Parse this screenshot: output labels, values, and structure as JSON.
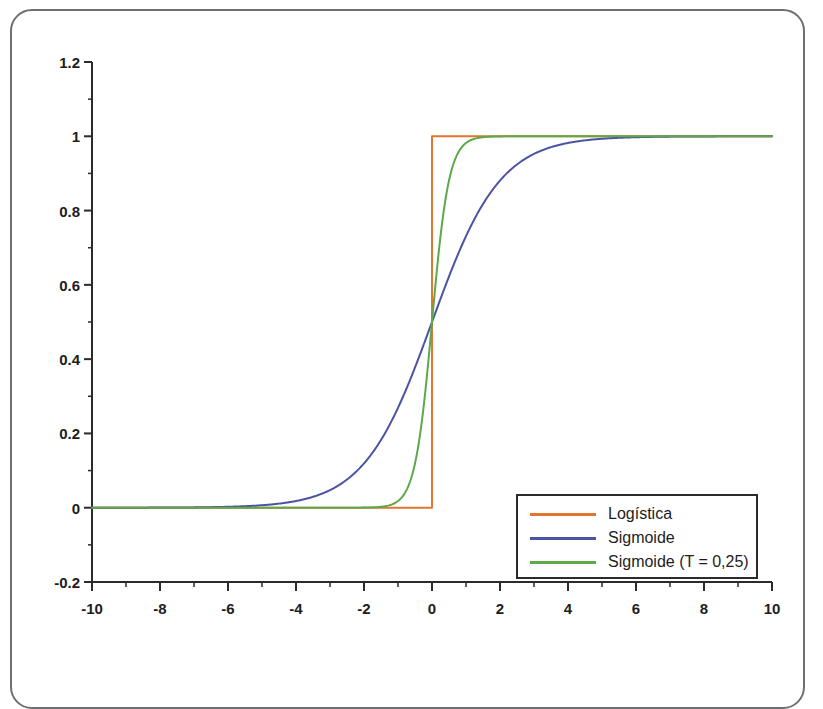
{
  "chart_data": {
    "type": "line",
    "title": "",
    "xlabel": "",
    "ylabel": "",
    "xlim": [
      -10,
      10
    ],
    "ylim": [
      -0.2,
      1.2
    ],
    "grid": false,
    "legend_position": "bottom-right",
    "x_ticks": [
      "-10",
      "-8",
      "-6",
      "-4",
      "-2",
      "0",
      "2",
      "4",
      "6",
      "8",
      "10"
    ],
    "x_tick_values": [
      -10,
      -8,
      -6,
      -4,
      -2,
      0,
      2,
      4,
      6,
      8,
      10
    ],
    "x_minor_tick_values": [
      -9,
      -7,
      -5,
      -3,
      -1,
      1,
      3,
      5,
      7,
      9
    ],
    "y_ticks": [
      "1.2",
      "1",
      "0.8",
      "0.6",
      "0.4",
      "0.2",
      "0",
      "-0.2"
    ],
    "y_tick_values": [
      1.2,
      1,
      0.8,
      0.6,
      0.4,
      0.2,
      0,
      -0.2
    ],
    "y_minor_tick_values": [
      1.1,
      0.9,
      0.7,
      0.5,
      0.3,
      0.1,
      -0.1
    ],
    "series": [
      {
        "name": "Logística",
        "color": "#e2762e",
        "kind": "step",
        "description": "Heaviside step: 0 for x<0, 1 for x>=0",
        "x": [
          -10,
          0,
          0,
          10
        ],
        "values": [
          0,
          0,
          1,
          1
        ]
      },
      {
        "name": "Sigmoide",
        "color": "#4b53a3",
        "kind": "logistic",
        "description": "1 / (1 + exp(-x))",
        "x": [
          -10,
          -9,
          -8,
          -7,
          -6,
          -5,
          -4,
          -3,
          -2,
          -1,
          0,
          1,
          2,
          3,
          4,
          5,
          6,
          7,
          8,
          9,
          10
        ],
        "values": [
          4.54e-05,
          0.0001234,
          0.0003354,
          0.0009111,
          0.0024726,
          0.0066929,
          0.0179862,
          0.0474259,
          0.1192029,
          0.2689414,
          0.5,
          0.7310586,
          0.8807971,
          0.9525741,
          0.9820138,
          0.9933071,
          0.9975274,
          0.9990889,
          0.9996646,
          0.9998766,
          0.9999546
        ]
      },
      {
        "name": "Sigmoide (T = 0,25)",
        "color": "#5da94a",
        "kind": "logistic",
        "description": "1 / (1 + exp(-x/0.25))",
        "x": [
          -10,
          -9,
          -8,
          -7,
          -6,
          -5,
          -4,
          -3,
          -2,
          -1.5,
          -1,
          -0.75,
          -0.5,
          -0.25,
          0,
          0.25,
          0.5,
          0.75,
          1,
          1.5,
          2,
          3,
          4,
          5,
          6,
          7,
          8,
          9,
          10
        ],
        "values": [
          0,
          0,
          0,
          0,
          0,
          0,
          1e-07,
          6.1e-06,
          0.0003354,
          0.0024726,
          0.0179862,
          0.0474259,
          0.1192029,
          0.2689414,
          0.5,
          0.7310586,
          0.8807971,
          0.9525741,
          0.9820138,
          0.9975274,
          0.9996646,
          0.9999939,
          0.9999999,
          1,
          1,
          1,
          1,
          1,
          1
        ]
      }
    ]
  },
  "legend": {
    "items": [
      {
        "label": "Logística",
        "color": "#e2762e"
      },
      {
        "label": "Sigmoide",
        "color": "#4b53a3"
      },
      {
        "label": "Sigmoide (T = 0,25)",
        "color": "#5da94a"
      }
    ]
  },
  "colors": {
    "logistica": "#e2762e",
    "sigmoide": "#4b53a3",
    "sigmoide_t": "#5da94a",
    "axis": "#2b2b2b",
    "frame": "#6d6f72",
    "background": "#ffffff"
  }
}
